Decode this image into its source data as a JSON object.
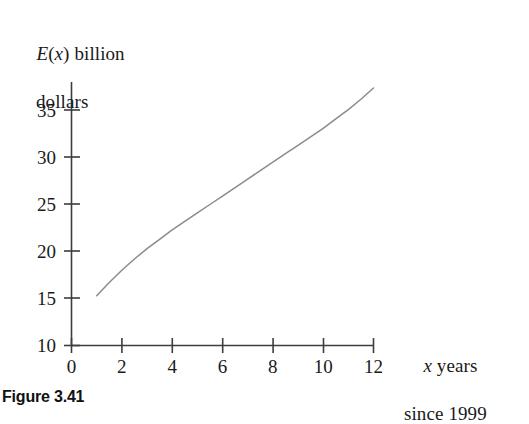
{
  "figure": {
    "caption": "Figure 3.41",
    "background_color": "#ffffff",
    "axis_color": "#3c3c41",
    "curve_color": "#8a8a90",
    "text_color": "#1a1a1a"
  },
  "axis_titles": {
    "y_line1_var": "E",
    "y_line1_paren_open": "(",
    "y_line1_paren_var": "x",
    "y_line1_paren_close": ")",
    "y_line1_rest": " billion",
    "y_line2": "dollars",
    "x_line1_var": "x",
    "x_line1_rest": " years",
    "x_line2": "since 1999"
  },
  "chart_data": {
    "type": "line",
    "title": "",
    "subtitle": "",
    "xlabel": "x years since 1999",
    "ylabel": "E(x) billion dollars",
    "xlim": [
      0,
      12
    ],
    "ylim": [
      10,
      37.5
    ],
    "xticks": [
      0,
      2,
      4,
      6,
      8,
      10,
      12
    ],
    "xtick_labels": [
      "0",
      "2",
      "4",
      "6",
      "8",
      "10",
      "12"
    ],
    "yticks": [
      10,
      15,
      20,
      25,
      30,
      35
    ],
    "ytick_labels": [
      "10",
      "15",
      "20",
      "25",
      "30",
      "35"
    ],
    "grid": false,
    "legend": null,
    "annotations": [],
    "series": [
      {
        "name": "E(x)",
        "color": "#8a8a90",
        "x": [
          1,
          1.5,
          2,
          2.5,
          3,
          3.5,
          4,
          4.5,
          5,
          5.5,
          6,
          6.5,
          7,
          7.5,
          8,
          8.5,
          9,
          9.5,
          10,
          10.5,
          11,
          11.5,
          12
        ],
        "y": [
          15.3,
          16.7,
          18.0,
          19.2,
          20.3,
          21.3,
          22.3,
          23.2,
          24.1,
          25.0,
          25.9,
          26.8,
          27.7,
          28.6,
          29.5,
          30.4,
          31.3,
          32.2,
          33.1,
          34.1,
          35.1,
          36.2,
          37.4
        ]
      }
    ]
  }
}
